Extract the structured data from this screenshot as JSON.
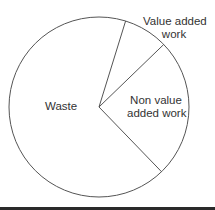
{
  "chart_data": {
    "type": "pie",
    "title": "",
    "categories": [
      "Waste",
      "Non value added work",
      "Value added work"
    ],
    "values": [
      67,
      25,
      8
    ],
    "unit": "percent (estimated from slice angles)",
    "start_angle_deg": 72.8,
    "direction": "clockwise",
    "legend": "none (labels placed inside/around slices)",
    "colors": {
      "fill": "#ffffff",
      "stroke": "#555555",
      "text": "#333333"
    }
  },
  "labels": {
    "waste": "Waste",
    "non_value_line1": "Non value",
    "non_value_line2": "added work",
    "value_line1": "Value added",
    "value_line2": "work"
  }
}
